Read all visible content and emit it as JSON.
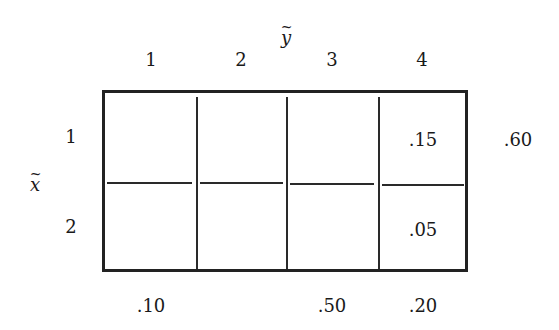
{
  "diagram": {
    "type": "joint-probability-table",
    "column_variable": {
      "symbol": "y",
      "accent": "~",
      "label": "ỹ"
    },
    "row_variable": {
      "symbol": "x",
      "accent": "~",
      "label": "x̃"
    },
    "column_headers": [
      "1",
      "2",
      "3",
      "4"
    ],
    "row_headers": [
      "1",
      "2"
    ],
    "cells": [
      [
        "",
        "",
        "",
        ".15"
      ],
      [
        "",
        "",
        "",
        ".05"
      ]
    ],
    "row_marginals": [
      ".60",
      ""
    ],
    "column_marginals": [
      ".10",
      "",
      ".50",
      ".20"
    ]
  }
}
